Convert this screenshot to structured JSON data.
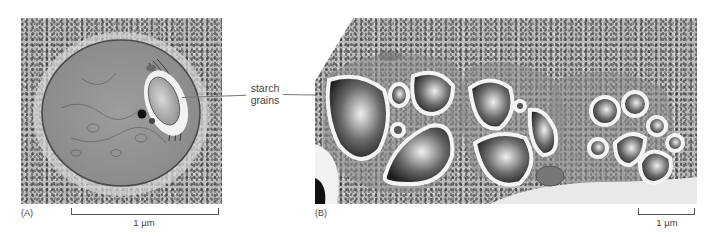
{
  "figure": {
    "callout": {
      "line1": "starch",
      "line2": "grains"
    },
    "panels": [
      {
        "id": "A",
        "label": "(A)",
        "description": "Electron micrograph of a single plastid (amyloplast) with a central starch grain, surrounded by granular cytoplasm",
        "scale_bar": {
          "label": "1 µm"
        }
      },
      {
        "id": "B",
        "label": "(B)",
        "description": "Electron micrograph of several plastids packed with multiple dark starch grains",
        "scale_bar": {
          "label": "1 µm"
        }
      }
    ]
  }
}
